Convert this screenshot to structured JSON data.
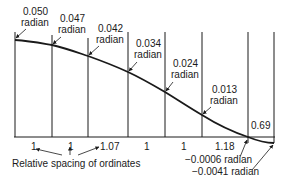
{
  "diagram": {
    "baseline_y": 137,
    "ordinates": [
      {
        "x": 15,
        "top": 32,
        "curve_y": 40
      },
      {
        "x": 52,
        "top": 35,
        "curve_y": 45
      },
      {
        "x": 88,
        "top": 38,
        "curve_y": 56
      },
      {
        "x": 128,
        "top": 32,
        "curve_y": 72
      },
      {
        "x": 165,
        "top": 32,
        "curve_y": 92
      },
      {
        "x": 202,
        "top": 32,
        "curve_y": 115
      },
      {
        "x": 248,
        "top": 32,
        "curve_y": 137
      },
      {
        "x": 274,
        "top": 32,
        "curve_y": 143
      }
    ],
    "slope_labels": [
      {
        "value": "0.050",
        "unit": "radian"
      },
      {
        "value": "0.047",
        "unit": "radian"
      },
      {
        "value": "0.042",
        "unit": "radian"
      },
      {
        "value": "0.034",
        "unit": "radian"
      },
      {
        "value": "0.024",
        "unit": "radian"
      },
      {
        "value": "0.013",
        "unit": "radian"
      }
    ],
    "negative_slopes": [
      {
        "text": "−0.0006 radian"
      },
      {
        "text": "−0.0041 radian"
      }
    ],
    "spacings": [
      "1",
      "1",
      "1.07",
      "1",
      "1",
      "1.18",
      "0.69"
    ],
    "spacing_caption": "Relative spacing of ordinates"
  }
}
